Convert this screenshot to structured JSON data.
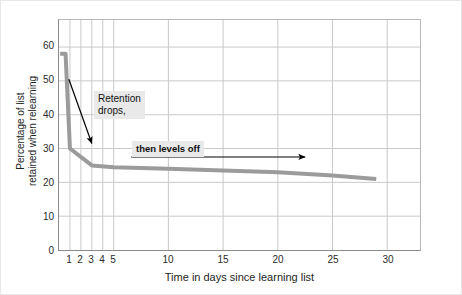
{
  "chart_data": {
    "type": "line",
    "title": "",
    "xlabel": "Time in days since learning list",
    "ylabel_line1": "Percentage of list",
    "ylabel_line2": "retained when relearning",
    "xlim": [
      0,
      33
    ],
    "ylim": [
      0,
      68
    ],
    "grid": true,
    "legend": "none",
    "x_ticks": [
      1,
      2,
      3,
      4,
      5,
      10,
      15,
      20,
      25,
      30
    ],
    "x_tick_labels": [
      "1",
      "2",
      "3",
      "4",
      "5",
      "10",
      "15",
      "20",
      "25",
      "30"
    ],
    "y_ticks": [
      0,
      10,
      20,
      30,
      40,
      50,
      60
    ],
    "y_tick_labels": [
      "0",
      "10",
      "20",
      "30",
      "40",
      "50",
      "60"
    ],
    "series": [
      {
        "name": "Retention curve",
        "color": "#9b9b9b",
        "linewidth": 4,
        "x": [
          0.1,
          0.6,
          1.0,
          3.0,
          5.0,
          10.0,
          15.0,
          20.0,
          25.0,
          29.0
        ],
        "y": [
          58.0,
          58.0,
          30.0,
          25.0,
          24.5,
          24.0,
          23.5,
          23.0,
          22.0,
          21.0
        ]
      }
    ],
    "annotations": [
      {
        "name": "retention-drops",
        "text_line1": "Retention",
        "text_line2": "drops,",
        "arrow": {
          "type": "diagonal",
          "x_start": 0.9,
          "y_start": 50.5,
          "x_end": 3.0,
          "y_end": 31.5
        }
      },
      {
        "name": "then-levels-off",
        "text_line1": "then levels off",
        "arrow": {
          "type": "horizontal",
          "x_start": 6.6,
          "x_end": 22.5,
          "y": 27.5
        }
      }
    ],
    "colors": {
      "line": "#9b9b9b",
      "grid": "#c9c9c9",
      "axis": "#8a8a8a",
      "text": "#1e1e1e",
      "callout_bg": "#e9e9e9",
      "arrow": "#000000",
      "background": "#ffffff"
    }
  }
}
